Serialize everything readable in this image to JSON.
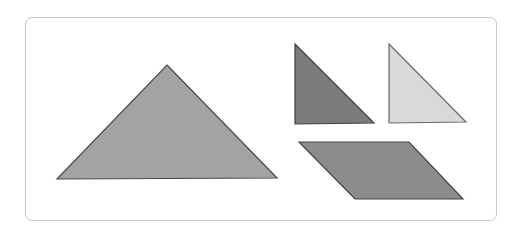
{
  "diagram": {
    "type": "tangram-pieces",
    "frame": {
      "border_color": "#c9c9c9",
      "background": "#ffffff"
    },
    "shapes": [
      {
        "id": "large-triangle",
        "kind": "isosceles right triangle",
        "points": "167,65 277,178 57,179",
        "fill": "#a3a3a3",
        "stroke": "#4a4a4a"
      },
      {
        "id": "dark-small-triangle",
        "kind": "right triangle",
        "points": "295,44 374,123 295,124",
        "fill": "#7b7b7b",
        "stroke": "#3f3f3f"
      },
      {
        "id": "light-small-triangle",
        "kind": "right triangle",
        "points": "389,44 466,122 389,123",
        "fill": "#d9d9d9",
        "stroke": "#6a6a6a"
      },
      {
        "id": "parallelogram",
        "kind": "parallelogram",
        "points": "299,142 409,142 463,199 355,199",
        "fill": "#8c8c8c",
        "stroke": "#444444"
      }
    ]
  }
}
